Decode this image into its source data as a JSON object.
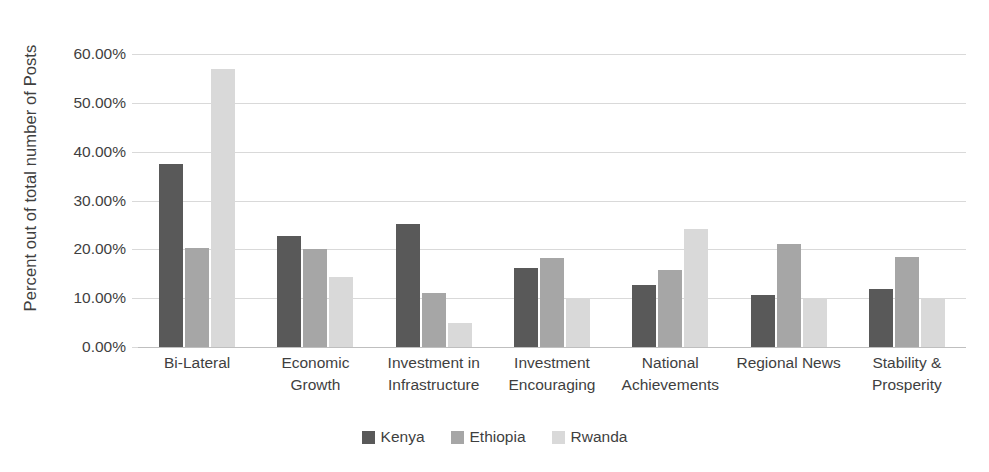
{
  "chart_data": {
    "type": "bar",
    "title": "",
    "subtitle": "",
    "xlabel": "",
    "ylabel": "Percent out of total number of Posts",
    "ylim": [
      0,
      60
    ],
    "ytick_labels": [
      "60.00%",
      "50.00%",
      "40.00%",
      "30.00%",
      "20.00%",
      "10.00%",
      "0.00%"
    ],
    "ytick_values": [
      60,
      50,
      40,
      30,
      20,
      10,
      0
    ],
    "grid": true,
    "legend_position": "bottom",
    "value_format": "percent",
    "categories": [
      "Bi-Lateral",
      "Economic Growth",
      "Investment in Infrastructure",
      "Investment Encouraging",
      "National Achievements",
      "Regional News",
      "Stability & Prosperity"
    ],
    "category_lines": [
      [
        "Bi-Lateral"
      ],
      [
        "Economic",
        "Growth"
      ],
      [
        "Investment in",
        "Infrastructure"
      ],
      [
        "Investment",
        "Encouraging"
      ],
      [
        "National",
        "Achievements"
      ],
      [
        "Regional News"
      ],
      [
        "Stability &",
        "Prosperity"
      ]
    ],
    "series": [
      {
        "name": "Kenya",
        "color": "#595959",
        "values": [
          37.5,
          22.7,
          25.2,
          16.2,
          12.8,
          10.6,
          11.9
        ]
      },
      {
        "name": "Ethiopia",
        "color": "#a6a6a6",
        "values": [
          20.2,
          20.1,
          11.0,
          18.3,
          15.7,
          21.1,
          18.5
        ]
      },
      {
        "name": "Rwanda",
        "color": "#d9d9d9",
        "values": [
          57.0,
          14.3,
          5.0,
          9.8,
          24.2,
          9.9,
          10.0
        ]
      }
    ]
  },
  "colors": {
    "kenya": "#595959",
    "ethiopia": "#a6a6a6",
    "rwanda": "#d9d9d9",
    "gridline": "#d9d9d9",
    "baseline": "#bfbfbf",
    "text": "#3f3f3f",
    "background": "#ffffff"
  }
}
